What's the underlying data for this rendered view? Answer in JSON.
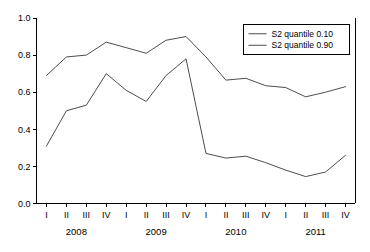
{
  "chart_data": {
    "type": "line",
    "title": "",
    "subtitle": "",
    "xlabel": "",
    "ylabel": "",
    "xlim": [
      0,
      15
    ],
    "ylim": [
      0.0,
      1.0
    ],
    "grid": false,
    "legend_position": "top-right",
    "categories": [
      "I",
      "II",
      "III",
      "IV",
      "I",
      "II",
      "III",
      "IV",
      "I",
      "II",
      "III",
      "IV",
      "I",
      "II",
      "III",
      "IV"
    ],
    "group_labels": [
      "2008",
      "2009",
      "2010",
      "2011"
    ],
    "ytick_labels": [
      "0.0",
      "0.2",
      "0.4",
      "0.6",
      "0.8",
      "1.0"
    ],
    "ytick_values": [
      0.0,
      0.2,
      0.4,
      0.6,
      0.8,
      1.0
    ],
    "series": [
      {
        "name": "S2 quantile 0.10",
        "color": "#4d4d4d",
        "values": [
          0.31,
          0.5,
          0.53,
          0.7,
          0.61,
          0.55,
          0.69,
          0.78,
          0.27,
          0.245,
          0.255,
          0.22,
          0.18,
          0.145,
          0.17,
          0.26
        ]
      },
      {
        "name": "S2 quantile 0.90",
        "color": "#4d4d4d",
        "values": [
          0.69,
          0.79,
          0.8,
          0.87,
          0.84,
          0.81,
          0.88,
          0.9,
          0.79,
          0.665,
          0.675,
          0.635,
          0.625,
          0.575,
          0.6,
          0.63
        ]
      }
    ],
    "annotations": []
  },
  "legend": {
    "entries": [
      {
        "label": "S2 quantile 0.10"
      },
      {
        "label": "S2 quantile 0.90"
      }
    ]
  }
}
